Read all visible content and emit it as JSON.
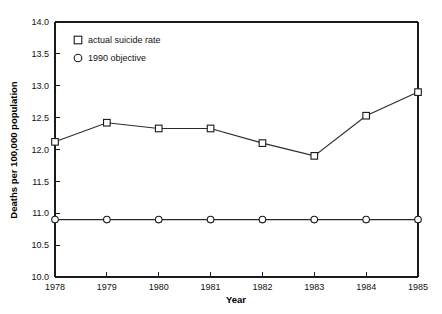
{
  "chart_data": {
    "type": "line",
    "title": "",
    "xlabel": "Year",
    "ylabel": "Deaths per 100,000 population",
    "categories": [
      "1978",
      "1979",
      "1980",
      "1981",
      "1982",
      "1983",
      "1984",
      "1985"
    ],
    "xlim": [
      1978,
      1985
    ],
    "ylim": [
      10.0,
      14.0
    ],
    "ytick_labels": [
      "10.0",
      "10.5",
      "11.0",
      "11.5",
      "12.0",
      "12.5",
      "13.0",
      "13.5",
      "14.0"
    ],
    "ytick_values": [
      10.0,
      10.5,
      11.0,
      11.5,
      12.0,
      12.5,
      13.0,
      13.5,
      14.0
    ],
    "xtick_labels": [
      "1978",
      "1979",
      "1980",
      "1981",
      "1982",
      "1983",
      "1984",
      "1985"
    ],
    "grid": false,
    "legend_position": "top-left-inside",
    "series": [
      {
        "name": "actual suicide rate",
        "marker": "square",
        "values": [
          12.12,
          12.42,
          12.33,
          12.33,
          12.1,
          11.9,
          12.53,
          12.9
        ]
      },
      {
        "name": "1990 objective",
        "marker": "circle",
        "values": [
          10.9,
          10.9,
          10.9,
          10.9,
          10.9,
          10.9,
          10.9,
          10.9
        ]
      }
    ]
  },
  "legend": {
    "entries": [
      {
        "label": "actual suicide rate",
        "marker": "square"
      },
      {
        "label": "1990 objective",
        "marker": "circle"
      }
    ]
  }
}
